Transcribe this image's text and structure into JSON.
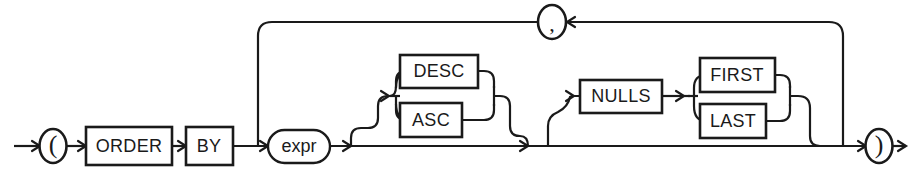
{
  "diagram": {
    "type": "railroad-syntax-diagram",
    "stroke_color": "#1a1a1a",
    "background_color": "#ffffff",
    "nodes": {
      "open_paren": {
        "label": "(",
        "shape": "circle",
        "kind": "terminal"
      },
      "order": {
        "label": "ORDER",
        "shape": "rect",
        "kind": "keyword"
      },
      "by": {
        "label": "BY",
        "shape": "rect",
        "kind": "keyword"
      },
      "expr": {
        "label": "expr",
        "shape": "oval",
        "kind": "nonterminal"
      },
      "desc": {
        "label": "DESC",
        "shape": "rect",
        "kind": "keyword"
      },
      "asc": {
        "label": "ASC",
        "shape": "rect",
        "kind": "keyword"
      },
      "nulls": {
        "label": "NULLS",
        "shape": "rect",
        "kind": "keyword"
      },
      "first": {
        "label": "FIRST",
        "shape": "rect",
        "kind": "keyword"
      },
      "last": {
        "label": "LAST",
        "shape": "rect",
        "kind": "keyword"
      },
      "comma": {
        "label": ",",
        "shape": "circle",
        "kind": "terminal"
      },
      "close_paren": {
        "label": ")",
        "shape": "circle",
        "kind": "terminal"
      }
    }
  }
}
